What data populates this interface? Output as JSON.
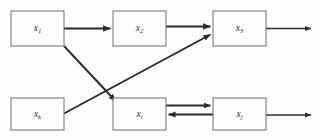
{
  "diagram": {
    "background_color": "#fdfdfd",
    "box_fill_color": "#fefefe",
    "box_stroke_color": "#6e6e72",
    "edge_color": "#2b2b2f",
    "label_color": "#2e2e32",
    "nodes": [
      {
        "id": "x1",
        "base": "x",
        "subscript": "1",
        "x": 11,
        "y": 11,
        "w": 53,
        "h": 35,
        "cx": 37.5,
        "cy": 28.5
      },
      {
        "id": "x2",
        "base": "x",
        "subscript": "2",
        "x": 113,
        "y": 11,
        "w": 53,
        "h": 35,
        "cx": 139.5,
        "cy": 28.5
      },
      {
        "id": "x3",
        "base": "x",
        "subscript": "3",
        "x": 213,
        "y": 11,
        "w": 53,
        "h": 35,
        "cx": 239.5,
        "cy": 28.5
      },
      {
        "id": "xk",
        "base": "x",
        "subscript": "k",
        "x": 11,
        "y": 98,
        "w": 53,
        "h": 32,
        "cx": 37.5,
        "cy": 114.0
      },
      {
        "id": "xi",
        "base": "x",
        "subscript": "i",
        "x": 113,
        "y": 98,
        "w": 53,
        "h": 32,
        "cx": 139.5,
        "cy": 114.0
      },
      {
        "id": "xj",
        "base": "x",
        "subscript": "j",
        "x": 213,
        "y": 98,
        "w": 53,
        "h": 32,
        "cx": 239.5,
        "cy": 114.0
      }
    ],
    "edges": [
      {
        "id": "e-x1-x2",
        "from": "x1",
        "to": "x2",
        "kind": "straight",
        "weight": "thick"
      },
      {
        "id": "e-x2-x3",
        "from": "x2",
        "to": "x3",
        "kind": "straight",
        "weight": "thick"
      },
      {
        "id": "e-x3-out",
        "from": "x3",
        "to": "exterior",
        "kind": "straight",
        "weight": "thin"
      },
      {
        "id": "e-x1-xi",
        "from": "x1",
        "to": "xi",
        "kind": "diagonal",
        "weight": "med"
      },
      {
        "id": "e-xk-x3",
        "from": "xk",
        "to": "x3",
        "kind": "diagonal",
        "weight": "med"
      },
      {
        "id": "e-xi-xj",
        "from": "xi",
        "to": "xj",
        "kind": "straight",
        "weight": "med"
      },
      {
        "id": "e-xj-xi",
        "from": "xj",
        "to": "xi",
        "kind": "straight",
        "weight": "med"
      },
      {
        "id": "e-xj-out",
        "from": "xj",
        "to": "exterior",
        "kind": "straight",
        "weight": "thin"
      }
    ]
  }
}
